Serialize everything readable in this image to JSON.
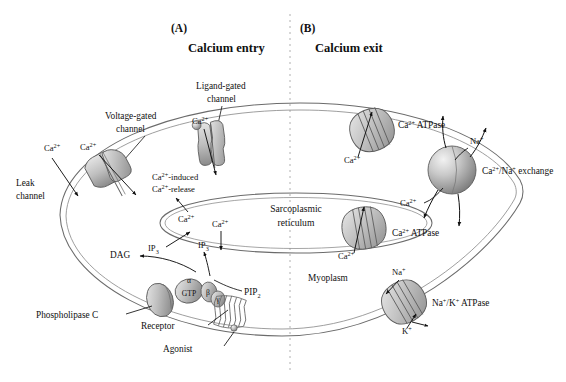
{
  "figure": {
    "type": "biological-diagram",
    "background_color": "#ffffff",
    "line_color": "#555555",
    "protein_fill": "#bdbdbd",
    "divider": "vertical dotted line separating panel A and panel B"
  },
  "panels": [
    {
      "letter": "(A)",
      "title": "Calcium entry"
    },
    {
      "letter": "(B)",
      "title": "Calcium exit"
    }
  ],
  "compartments": {
    "cell": "Myoplasm",
    "organelle": "Sarcoplasmic\nreticulum",
    "organelle_line1": "Sarcoplasmic",
    "organelle_line2": "reticulum"
  },
  "labels": {
    "leak_channel_line1": "Leak",
    "leak_channel_line2": "channel",
    "voltage_gated_line1": "Voltage-gated",
    "voltage_gated_line2": "channel",
    "ligand_gated_line1": "Ligand-gated",
    "ligand_gated_line2": "channel",
    "cicr_line1": "-induced",
    "cicr_line2": "-release",
    "sr_line1": "Sarcoplasmic",
    "sr_line2": "reticulum",
    "myoplasm": "Myoplasm",
    "phospholipase_c": "Phospholipase C",
    "receptor": "Receptor",
    "agonist": "Agonist",
    "dag": "DAG",
    "ip3_base": "IP",
    "ip3_sub": "3",
    "pip2_base": "PIP",
    "pip2_sub": "2",
    "gtp": "GTP",
    "g_alpha": "α",
    "g_beta": "β",
    "g_gamma": "γ",
    "ca_atpase_plasma": "ATPase",
    "ca_atpase_sr": "ATPase",
    "ca_na_exchange": "/Na",
    "ca_na_exchange_word": "exchange",
    "na_k_atpase": "ATPase"
  },
  "ions": {
    "calcium_base": "Ca",
    "calcium_charge": "2+",
    "sodium_base": "Na",
    "sodium_charge": "+",
    "potassium_base": "K",
    "potassium_charge": "+"
  },
  "ion_labels": [
    {
      "id": "ca-leak",
      "text": "Ca2+",
      "x": 44,
      "y": 148
    },
    {
      "id": "ca-voltage",
      "text": "Ca2+",
      "x": 82,
      "y": 147
    },
    {
      "id": "ca-ligand",
      "text": "Ca2+",
      "x": 196,
      "y": 120
    },
    {
      "id": "ca-sr-in",
      "text": "Ca2+",
      "x": 186,
      "y": 215
    },
    {
      "id": "ca-sr-out",
      "text": "Ca2+",
      "x": 218,
      "y": 220
    },
    {
      "id": "ca-atpase-pm",
      "text": "Ca2+",
      "x": 352,
      "y": 160
    },
    {
      "id": "ca-atpase-sr",
      "text": "Ca2+",
      "x": 344,
      "y": 256
    },
    {
      "id": "ca-exchange",
      "text": "Ca2+",
      "x": 406,
      "y": 203
    },
    {
      "id": "na-exchange",
      "text": "Na+",
      "x": 474,
      "y": 141
    },
    {
      "id": "na-pump",
      "text": "Na+",
      "x": 398,
      "y": 272
    },
    {
      "id": "k-pump",
      "text": "K+",
      "x": 406,
      "y": 331
    }
  ],
  "transport_proteins": [
    {
      "name": "voltage-gated-channel",
      "shape": "double-lobe-channel",
      "x": 110,
      "y": 172
    },
    {
      "name": "ligand-gated-channel",
      "shape": "hourglass-channel",
      "x": 214,
      "y": 140
    },
    {
      "name": "sr-release-channel",
      "shape": "implied-pore",
      "x": 196,
      "y": 208
    },
    {
      "name": "ca-atpase-plasma",
      "shape": "striped-barrel",
      "x": 372,
      "y": 130
    },
    {
      "name": "ca-na-exchanger",
      "shape": "sphere",
      "x": 452,
      "y": 170
    },
    {
      "name": "ca-atpase-sr",
      "shape": "striped-barrel",
      "x": 364,
      "y": 228
    },
    {
      "name": "na-k-atpase",
      "shape": "striped-barrel",
      "x": 404,
      "y": 302
    },
    {
      "name": "phospholipase-c",
      "shape": "oval",
      "x": 160,
      "y": 300
    },
    {
      "name": "g-protein-alpha",
      "shape": "oval-gtp",
      "x": 190,
      "y": 290
    },
    {
      "name": "g-protein-beta-gamma",
      "shape": "double-oval",
      "x": 213,
      "y": 296
    },
    {
      "name": "receptor",
      "shape": "seven-helix",
      "x": 232,
      "y": 312
    }
  ],
  "arrows": [
    {
      "from": "Ca2+ extracellular",
      "to": "leak channel pore",
      "direction": "inward"
    },
    {
      "from": "Ca2+ extracellular",
      "to": "voltage-gated pore",
      "direction": "inward"
    },
    {
      "from": "Ca2+ extracellular",
      "to": "ligand-gated pore",
      "direction": "inward"
    },
    {
      "from": "sarcoplasmic reticulum",
      "to": "myoplasm",
      "direction": "release"
    },
    {
      "from": "myoplasm",
      "to": "extracellular via Ca2+ ATPase",
      "direction": "outward"
    },
    {
      "from": "myoplasm",
      "to": "SR via Ca2+ ATPase",
      "direction": "uptake"
    },
    {
      "from": "Ca2+/Na+ exchanger",
      "to": "bidirectional",
      "direction": "exchange"
    },
    {
      "from": "Na+/K+ ATPase",
      "to": "bidirectional",
      "direction": "exchange"
    },
    {
      "from": "PIP2",
      "to": "DAG and IP3",
      "direction": "hydrolysis"
    },
    {
      "from": "IP3",
      "to": "sarcoplasmic reticulum",
      "direction": "signal"
    }
  ]
}
